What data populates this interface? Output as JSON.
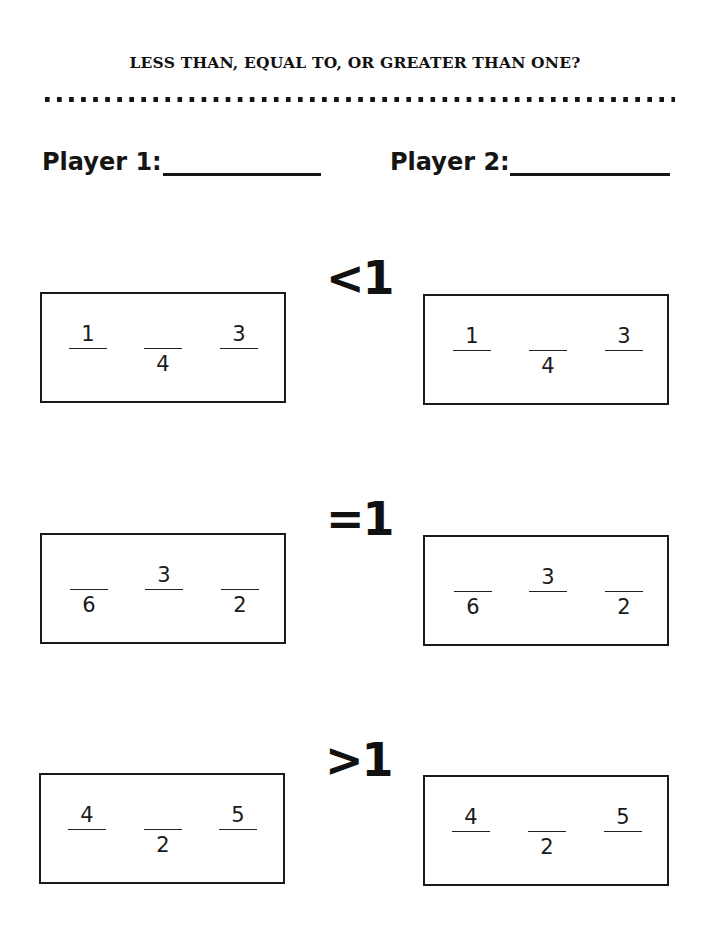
{
  "title": "LESS THAN, EQUAL TO, OR GREATER THAN ONE?",
  "players": [
    {
      "label": "Player 1:",
      "value": ""
    },
    {
      "label": "Player 2:",
      "value": ""
    }
  ],
  "rows": [
    {
      "symbol": "<1",
      "player1_cards": [
        {
          "num": "1",
          "den": ""
        },
        {
          "num": "",
          "den": "4"
        },
        {
          "num": "3",
          "den": ""
        }
      ],
      "player2_cards": [
        {
          "num": "1",
          "den": ""
        },
        {
          "num": "",
          "den": "4"
        },
        {
          "num": "3",
          "den": ""
        }
      ]
    },
    {
      "symbol": "=1",
      "player1_cards": [
        {
          "num": "",
          "den": "6"
        },
        {
          "num": "3",
          "den": ""
        },
        {
          "num": "",
          "den": "2"
        }
      ],
      "player2_cards": [
        {
          "num": "",
          "den": "6"
        },
        {
          "num": "3",
          "den": ""
        },
        {
          "num": "",
          "den": "2"
        }
      ]
    },
    {
      "symbol": ">1",
      "player1_cards": [
        {
          "num": "4",
          "den": ""
        },
        {
          "num": "",
          "den": "2"
        },
        {
          "num": "5",
          "den": ""
        }
      ],
      "player2_cards": [
        {
          "num": "4",
          "den": ""
        },
        {
          "num": "",
          "den": "2"
        },
        {
          "num": "5",
          "den": ""
        }
      ]
    }
  ]
}
